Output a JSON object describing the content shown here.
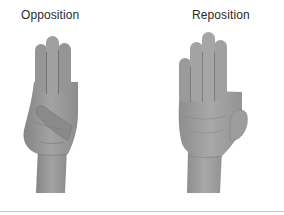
{
  "figure": {
    "panels": [
      {
        "label": "Opposition",
        "image": "hand-opposition-thumb-across-palm",
        "description": "Hand with thumb folded across palm touching base of little finger; index, middle and ring fingers extended together"
      },
      {
        "label": "Reposition",
        "image": "hand-reposition-open-palm",
        "description": "Open palm facing viewer with fingers extended together and thumb returned to side"
      }
    ],
    "colors": {
      "background": "#ffffff",
      "label_text": "#2a2a2a",
      "skin_tone": "#9a9a9a",
      "skin_shadow": "#7c7c7c",
      "skin_highlight": "#b5b5b5",
      "rule": "#c8c8c8"
    }
  }
}
